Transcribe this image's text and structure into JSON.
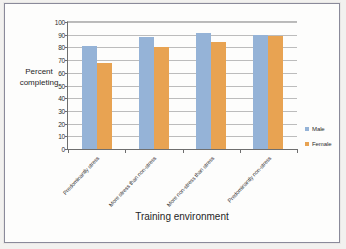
{
  "chart_data": {
    "type": "bar",
    "title": "",
    "xlabel": "Training environment",
    "ylabel": "Percent completing",
    "ylabel_line1": "Percent",
    "ylabel_line2": "completing",
    "categories": [
      "Predominantly stress",
      "More stress than non-stress",
      "More non-stress than stress",
      "Predominantly non-stress"
    ],
    "series": [
      {
        "name": "Male",
        "color": "#95b3d7",
        "values": [
          81,
          88,
          91,
          90
        ]
      },
      {
        "name": "Female",
        "color": "#e8a352",
        "values": [
          68,
          80,
          84,
          89
        ]
      }
    ],
    "ylim": [
      0,
      100
    ],
    "yticks": [
      100,
      90,
      80,
      70,
      60,
      50,
      40,
      30,
      20,
      10,
      0
    ],
    "grid": true,
    "legend_position": "right"
  }
}
